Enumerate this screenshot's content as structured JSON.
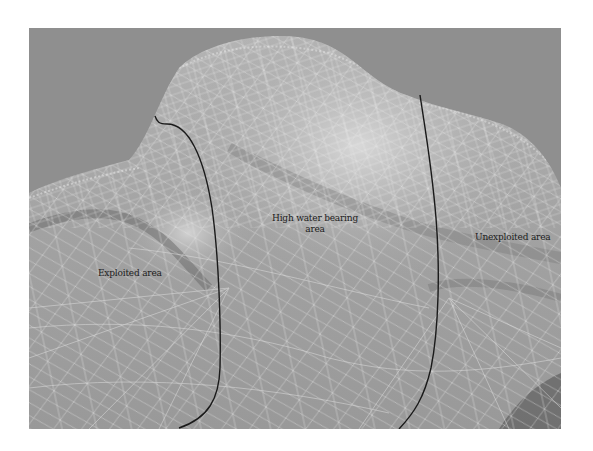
{
  "figure": {
    "type": "3D mesh terrain surface with region annotations",
    "colors": {
      "background": "#8e8e8e",
      "surface_light": "#d4d4d4",
      "surface_mid": "#a8a8a8",
      "surface_dark": "#6a6a6a",
      "mesh_lines": "#e8e8e8",
      "boundary_lines": "#1a1a1a",
      "label_text": "#1c1c1c"
    },
    "regions": [
      {
        "id": "exploited",
        "label": "Exploited area"
      },
      {
        "id": "high-water-bearing",
        "label": "High water bearing area",
        "line1": "High water bearing",
        "line2": "area"
      },
      {
        "id": "unexploited",
        "label": "Unexploited area"
      }
    ],
    "boundaries": [
      {
        "name": "left-boundary",
        "description": "curve separating exploited and high water bearing areas"
      },
      {
        "name": "right-boundary",
        "description": "curve separating high water bearing and unexploited areas"
      }
    ]
  }
}
